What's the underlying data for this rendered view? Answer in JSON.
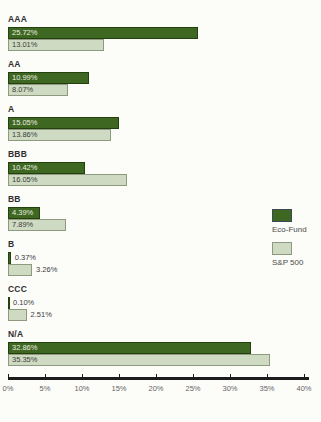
{
  "chart_data": {
    "type": "bar",
    "orientation": "horizontal",
    "title": "",
    "xlabel": "",
    "ylabel": "",
    "categories": [
      "AAA",
      "AA",
      "A",
      "BBB",
      "BB",
      "B",
      "CCC",
      "N/A"
    ],
    "series": [
      {
        "name": "Eco-Fund",
        "color": "#3e6721",
        "border_color": "#24400f",
        "label_color": "#eceee2",
        "values": [
          25.72,
          10.99,
          15.05,
          10.42,
          4.39,
          0.37,
          0.1,
          32.86
        ],
        "labels": [
          "25.72%",
          "10.99%",
          "15.05%",
          "10.42%",
          "4.39%",
          "0.37%",
          "0.10%",
          "32.86%"
        ]
      },
      {
        "name": "S&P 500",
        "color": "#cedbc2",
        "border_color": "#8e9a80",
        "label_color": "#3c3c3c",
        "values": [
          13.01,
          8.07,
          13.86,
          16.05,
          7.89,
          3.26,
          2.51,
          35.35
        ],
        "labels": [
          "13.01%",
          "8.07%",
          "13.86%",
          "16.05%",
          "7.89%",
          "3.26%",
          "2.51%",
          "35.35%"
        ]
      }
    ],
    "xlim": [
      0,
      40
    ],
    "x_ticks": [
      0,
      5,
      10,
      15,
      20,
      25,
      30,
      35,
      40
    ],
    "x_tick_labels": [
      "0%",
      "5%",
      "10%",
      "15%",
      "20%",
      "25%",
      "30%",
      "35%",
      "40%"
    ],
    "grid": false,
    "legend": {
      "position": "right",
      "entries": [
        "Eco-Fund",
        "S&P 500"
      ]
    }
  },
  "colors": {
    "background": "#fcfcf9",
    "axis_line": "#1c1c1c",
    "axis_label": "#666666",
    "category_label": "#2e2e2e"
  }
}
